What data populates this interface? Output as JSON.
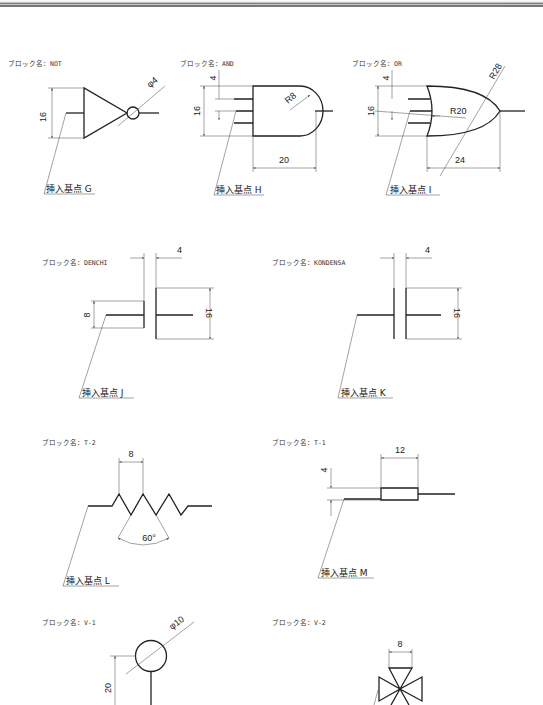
{
  "blocks": [
    {
      "name_label": "ブロック名：NOT",
      "insert_label": "挿入基点 G",
      "dims": [
        "16",
        "φ4"
      ]
    },
    {
      "name_label": "ブロック名：AND",
      "insert_label": "挿入基点 H",
      "dims": [
        "4",
        "16",
        "R8",
        "20"
      ]
    },
    {
      "name_label": "ブロック名：OR",
      "insert_label": "挿入基点 I",
      "dims": [
        "4",
        "16",
        "R20",
        "R28",
        "24"
      ]
    },
    {
      "name_label": "ブロック名：DENCHI",
      "insert_label": "挿入基点 J",
      "dims": [
        "4",
        "8",
        "16"
      ]
    },
    {
      "name_label": "ブロック名：KONDENSA",
      "insert_label": "挿入基点 K",
      "dims": [
        "4",
        "16"
      ]
    },
    {
      "name_label": "ブロック名：T-2",
      "insert_label": "挿入基点 L",
      "dims": [
        "8",
        "60°"
      ]
    },
    {
      "name_label": "ブロック名：T-1",
      "insert_label": "挿入基点 M",
      "dims": [
        "4",
        "12"
      ]
    },
    {
      "name_label": "ブロック名：V-1",
      "insert_label": "",
      "dims": [
        "φ10",
        "20"
      ]
    },
    {
      "name_label": "ブロック名：V-2",
      "insert_label": "",
      "dims": [
        "8"
      ]
    }
  ]
}
